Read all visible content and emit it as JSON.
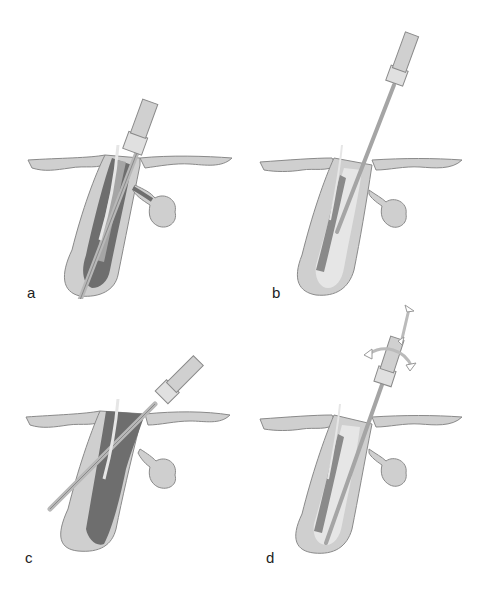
{
  "figure": {
    "panels": [
      {
        "id": "a",
        "label": "a",
        "description": "Probe with sheath inserted into follicle, tip extending past bulb"
      },
      {
        "id": "b",
        "label": "b",
        "description": "Thin needle inserted into follicle alongside hair shaft"
      },
      {
        "id": "c",
        "label": "c",
        "description": "Needle inserted obliquely across follicle, darkened upper follicle"
      },
      {
        "id": "d",
        "label": "d",
        "description": "Probe inserted with arrows indicating up-down and rotational motion"
      }
    ],
    "colors": {
      "skin": "#cfcfcf",
      "outline": "#8a8a8a",
      "dark_fill": "#6e6e6e",
      "mid_fill": "#a5a5a5",
      "light_fill": "#e6e6e6",
      "handle": "#e0e0e0"
    }
  }
}
